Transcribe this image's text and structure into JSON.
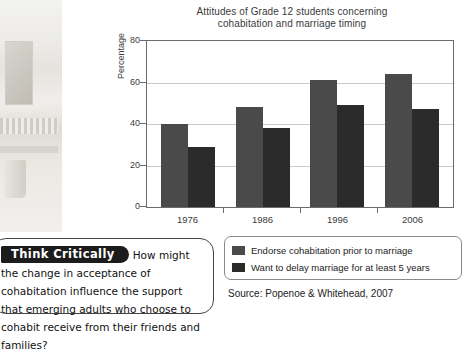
{
  "chart_data": {
    "type": "bar",
    "title": "Attitudes of Grade 12 students concerning\ncohabitation and marriage timing",
    "xlabel": "",
    "ylabel": "Percentage",
    "categories": [
      "1976",
      "1986",
      "1996",
      "2006"
    ],
    "series": [
      {
        "name": "Endorse cohabitation prior to marriage",
        "values": [
          40,
          48,
          61,
          64
        ],
        "color": "#4a4a4a"
      },
      {
        "name": "Want to delay marriage for at least 5 years",
        "values": [
          29,
          38,
          49,
          47
        ],
        "color": "#2b2b2b"
      }
    ],
    "ylim": [
      0,
      80
    ],
    "yticks": [
      "0",
      "20",
      "40",
      "60",
      "80"
    ],
    "grid": true,
    "legend_position": "bottom-right",
    "source": "Source: Popenoe & Whitehead, 2007"
  },
  "think_critically": {
    "badge": "Think Critically",
    "question": "How might the change in acceptance of cohabitation influence the support that emerging adults who choose to cohabit receive from their friends and families?"
  }
}
